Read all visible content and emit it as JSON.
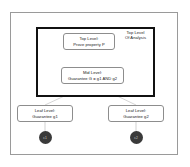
{
  "diagram": {
    "type": "tree-diagram",
    "scope": {
      "label_line1": "Top Level",
      "label_line2": "Of Analysis"
    },
    "nodes": [
      {
        "id": "top",
        "role": "top-level",
        "line1": "Top Level:",
        "line2": "Prove property P"
      },
      {
        "id": "mid",
        "role": "mid-level",
        "line1": "Mid Level:",
        "line2": "Guarantee G = g1 AND g2"
      },
      {
        "id": "leaf1",
        "role": "leaf-level",
        "line1": "Leaf Level:",
        "line2": "Guarantee g1"
      },
      {
        "id": "leaf2",
        "role": "leaf-level",
        "line1": "Leaf Level:",
        "line2": "Guarantee g2"
      }
    ],
    "terminals": [
      {
        "id": "term1",
        "label": "c1"
      },
      {
        "id": "term2",
        "label": "c2"
      }
    ],
    "colors": {
      "background": "#ffffff",
      "outer_frame": "#9a9a9a",
      "scope_border": "#111111",
      "node_border": "#8d8d8d",
      "connector": "#b9b9b9",
      "terminal_fill": "#3a3a3a",
      "text": "#1a1a1a"
    }
  }
}
